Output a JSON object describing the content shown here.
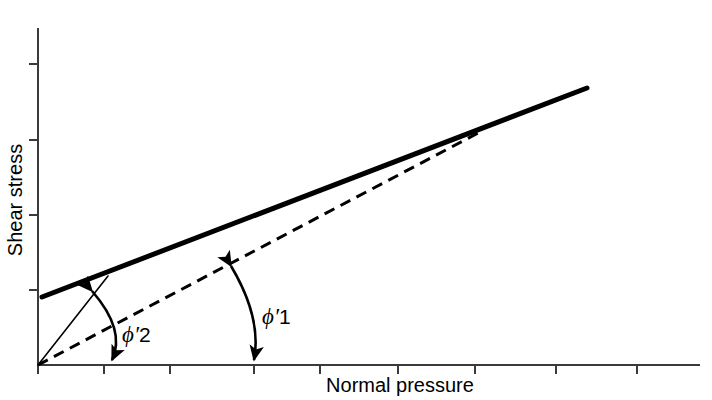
{
  "figure": {
    "name": "shear-strength-envelope-diagram",
    "background_color": "#ffffff",
    "line_color": "#000000",
    "width": 712,
    "height": 400
  },
  "axes": {
    "x": {
      "label": "Normal pressure",
      "label_x": 400,
      "label_y": 392,
      "start_x": 38,
      "end_x": 700,
      "y": 365,
      "tick_length": 9,
      "tick_positions": [
        38,
        104,
        170,
        254,
        320,
        398,
        475,
        556,
        637
      ],
      "tick_labels": []
    },
    "y": {
      "label": "Shear stress",
      "label_x": 22,
      "label_y": 200,
      "start_y": 28,
      "end_y": 365,
      "x": 38,
      "tick_length": 9,
      "tick_positions": [
        64,
        140,
        215,
        290
      ],
      "tick_labels": []
    }
  },
  "chart_data": {
    "type": "line",
    "title": "",
    "xlabel": "Normal pressure",
    "ylabel": "Shear stress",
    "xlim": [
      38,
      700
    ],
    "ylim": [
      365,
      28
    ],
    "grid": false,
    "legend": null,
    "series": [
      {
        "name": "peak-strength-envelope",
        "style": "solid-thick",
        "stroke_width": 5,
        "x": [
          42,
          587
        ],
        "y": [
          297,
          88
        ],
        "description": "Thick solid peak strength envelope with cohesion intercept"
      },
      {
        "name": "critical-state-envelope",
        "style": "dashed",
        "stroke_width": 3,
        "dash_pattern": "11,7",
        "x": [
          38,
          480
        ],
        "y": [
          365,
          132
        ],
        "description": "Dashed critical state line through the origin, angle phi prime 1"
      },
      {
        "name": "secant-peak-line",
        "style": "solid-thin",
        "stroke_width": 1.6,
        "x": [
          38,
          108
        ],
        "y": [
          365,
          276
        ],
        "description": "Thin secant line from origin to low-stress point on peak envelope, angle phi prime 2"
      }
    ]
  },
  "annotations": [
    {
      "name": "phi-prime-2",
      "symbol": "ϕ",
      "prime": "′",
      "subscript_text": "2",
      "full_text": "ϕ′2",
      "label_x": 122,
      "label_y": 342,
      "arc": {
        "from_x": 92,
        "from_y": 291,
        "ctrl_x": 126,
        "ctrl_y": 330,
        "to_x": 112,
        "to_y": 360,
        "double_headed": true
      },
      "description": "Angle between the thin secant line and the horizontal axis"
    },
    {
      "name": "phi-prime-1",
      "symbol": "ϕ",
      "prime": "′",
      "subscript_text": "1",
      "label_x": 262,
      "label_y": 324,
      "full_text": "ϕ′1",
      "arc": {
        "from_x": 231,
        "from_y": 266,
        "ctrl_x": 262,
        "ctrl_y": 318,
        "to_x": 254,
        "to_y": 360,
        "double_headed": true
      },
      "description": "Angle between the dashed critical state line and the horizontal axis"
    }
  ]
}
